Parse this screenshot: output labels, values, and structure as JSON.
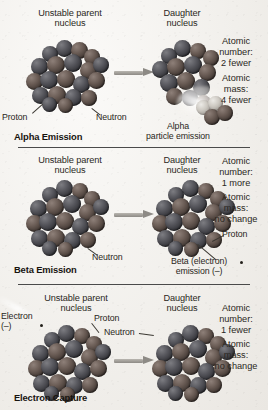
{
  "figure": {
    "background_color": "#f1efeb",
    "divider_color": "#4a4a4a"
  },
  "panels": [
    {
      "id": "alpha",
      "section_title": "Alpha Emission",
      "parent_label": "Unstable parent\nnucleus",
      "daughter_label": "Daughter\nnucleus",
      "callouts": [
        {
          "name": "proton",
          "text": "Proton"
        },
        {
          "name": "neutron",
          "text": "Neutron"
        },
        {
          "name": "alpha-particle",
          "text": "Alpha\nparticle emission"
        }
      ],
      "annotations": [
        {
          "name": "atomic-number",
          "text": "Atomic\nnumber:\n2 fewer"
        },
        {
          "name": "atomic-mass",
          "text": "Atomic\nmass:\n4 fewer"
        }
      ]
    },
    {
      "id": "beta",
      "section_title": "Beta Emission",
      "parent_label": "Unstable parent\nnucleus",
      "daughter_label": "Daughter\nnucleus",
      "callouts": [
        {
          "name": "neutron",
          "text": "Neutron"
        },
        {
          "name": "proton",
          "text": "Proton"
        },
        {
          "name": "beta-electron",
          "text": "Beta (electron)\nemission (–)"
        }
      ],
      "annotations": [
        {
          "name": "atomic-number",
          "text": "Atomic\nnumber:\n1 more"
        },
        {
          "name": "atomic-mass",
          "text": "Atomic\nmass:\nno change"
        }
      ]
    },
    {
      "id": "capture",
      "section_title": "Electron Capture",
      "parent_label": "Unstable parent\nnucleus",
      "daughter_label": "Daughter\nnucleus",
      "callouts": [
        {
          "name": "electron",
          "text": "Electron\n(–)"
        },
        {
          "name": "proton",
          "text": "Proton"
        },
        {
          "name": "neutron",
          "text": "Neutron"
        }
      ],
      "annotations": [
        {
          "name": "atomic-number",
          "text": "Atomic\nnumber:\n1 fewer"
        },
        {
          "name": "atomic-mass",
          "text": "Atomic\nmass:\nno change"
        }
      ]
    }
  ]
}
